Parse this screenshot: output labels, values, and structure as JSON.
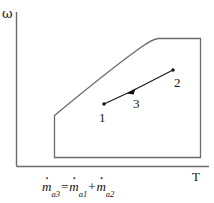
{
  "figure": {
    "type": "psychrometric-chart-schematic",
    "axes": {
      "y_label": "ω",
      "y_label_name": "humidity-ratio-omega",
      "x_label": "T",
      "x_label_name": "temperature-T",
      "y_axis_x": 16,
      "x_axis_y": 166,
      "origin": [
        16,
        166
      ]
    },
    "chart_body": {
      "left": 54,
      "right": 200,
      "bottom": 157,
      "top": 38,
      "left_kink_y": 115,
      "saturation_curve_start": [
        54,
        115
      ],
      "saturation_curve_knee": [
        158,
        38
      ],
      "saturation_curve_end": [
        200,
        38
      ],
      "stroke": "#6b6b6b"
    },
    "points": [
      {
        "id": "1",
        "label": "1",
        "x": 104,
        "y": 104,
        "label_x": 99,
        "label_y": 111,
        "marker": "dot"
      },
      {
        "id": "3",
        "label": "3",
        "x": 132,
        "y": 91,
        "label_x": 133,
        "label_y": 97,
        "marker": "arrowhead"
      },
      {
        "id": "2",
        "label": "2",
        "x": 173,
        "y": 70,
        "label_x": 174,
        "label_y": 76,
        "marker": "dot"
      }
    ],
    "process_line": {
      "name": "mixing-process-line",
      "from": [
        104,
        104
      ],
      "to": [
        173,
        70
      ],
      "via": [
        132,
        91
      ],
      "stroke": "#111111"
    },
    "equations": [
      {
        "id": "mass-balance-dry-air",
        "text": "ṁa3 = ṁa1 + ṁa2",
        "lhs_sym": "m",
        "lhs_sub": "a3",
        "t1_sym": "m",
        "t1_sub": "a1",
        "t2_sym": "m",
        "t2_sub": "a2",
        "eq": "=",
        "plus": "+",
        "x": 42,
        "y": 180
      }
    ]
  }
}
